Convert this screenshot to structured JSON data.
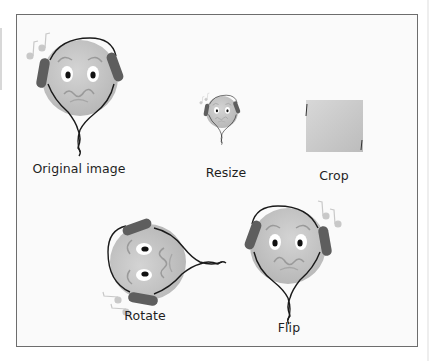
{
  "figure": {
    "panels": [
      {
        "id": "original",
        "label": "Original image"
      },
      {
        "id": "resize",
        "label": "Resize"
      },
      {
        "id": "crop",
        "label": "Crop"
      },
      {
        "id": "rotate",
        "label": "Rotate"
      },
      {
        "id": "flip",
        "label": "Flip"
      }
    ],
    "colors": {
      "frame_border": "#6d6d6d",
      "frame_bg": "#fafafa",
      "face_fill": "#c4c4c4",
      "headphone": "#5e5e5e",
      "cord": "#1a1a1a",
      "note": "#c8c8c8"
    }
  }
}
